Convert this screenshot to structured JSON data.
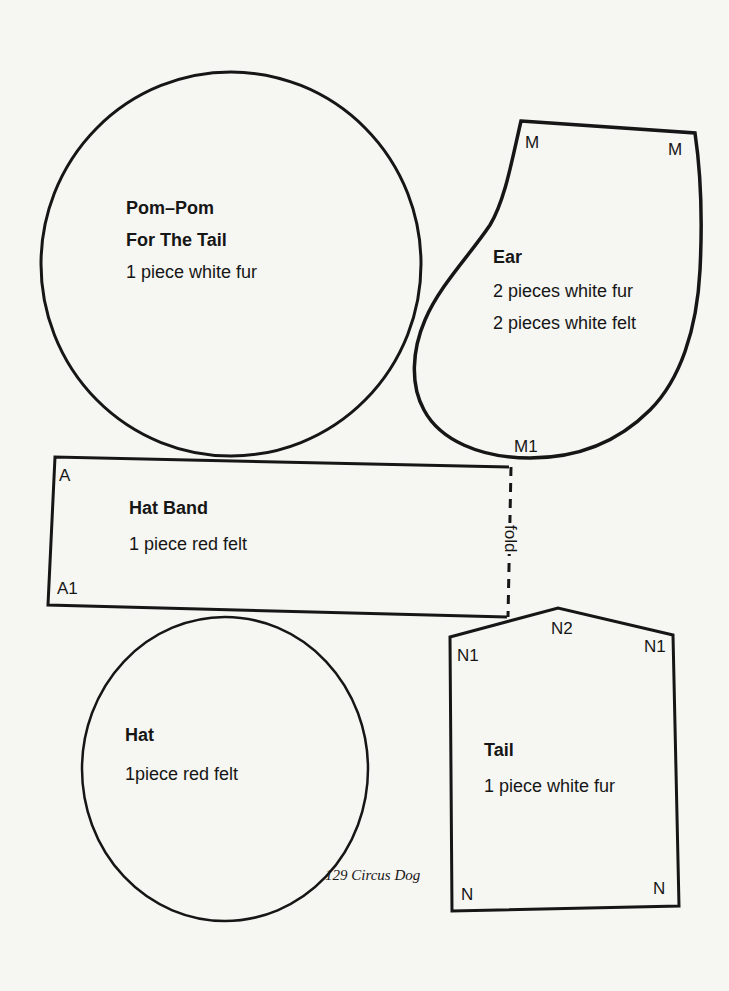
{
  "page": {
    "footer": "129 Circus Dog",
    "background_color": "#f6f6f3",
    "line_color": "#161616"
  },
  "pieces": {
    "pompom": {
      "title_line1": "Pom–Pom",
      "title_line2": "For The  Tail",
      "instructions": "1 piece white fur"
    },
    "ear": {
      "title": "Ear",
      "instructions": [
        "2 pieces white fur",
        "2 pieces white felt"
      ],
      "marks": [
        "M",
        "M",
        "M1"
      ]
    },
    "hat_band": {
      "title": "Hat  Band",
      "instructions": "1 piece red felt",
      "marks": [
        "A",
        "A1"
      ],
      "fold_label": "fold"
    },
    "hat": {
      "title": "Hat",
      "instructions": "1piece red felt"
    },
    "tail": {
      "title": "Tail",
      "instructions": "1 piece white fur",
      "marks": [
        "N1",
        "N2",
        "N1",
        "N",
        "N"
      ]
    }
  }
}
